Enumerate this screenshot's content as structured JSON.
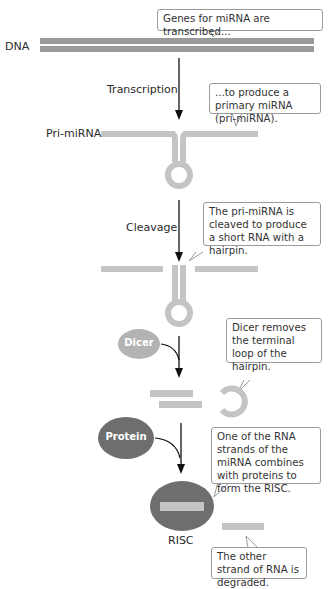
{
  "labels": {
    "dna": "DNA",
    "transcription": "Transcription",
    "pri_mirna": "Pri-miRNA",
    "cleavage": "Cleavage",
    "dicer": "Dicer",
    "protein": "Protein",
    "risc": "RISC"
  },
  "callouts": {
    "genes": "Genes for miRNA are transcribed...",
    "primary": "...to produce a primary miRNA (pri-miRNA).",
    "cleaved": "The pri-miRNA is cleaved to produce a short RNA with a hairpin.",
    "dicer_removes": "Dicer removes the terminal loop of the hairpin.",
    "one_strand": "One of the RNA strands of the miRNA combines with proteins to form the RISC.",
    "other_strand": "The other strand of RNA is degraded."
  },
  "colors": {
    "dna": "#9a9a9a",
    "rna": "#c4c4c4",
    "dicer": "#b3b3b3",
    "protein": "#6e6e6e",
    "arrow": "#111111"
  }
}
